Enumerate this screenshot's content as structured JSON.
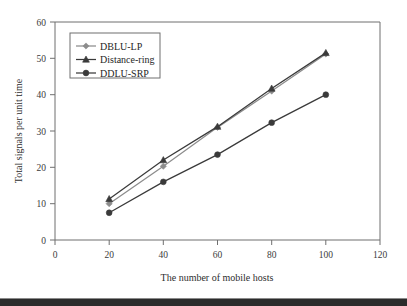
{
  "chart_data": {
    "type": "line",
    "title": "",
    "xlabel": "The number of mobile hosts",
    "ylabel": "Total signals per unit time",
    "xlim": [
      0,
      120
    ],
    "ylim": [
      0,
      60
    ],
    "xticks": [
      0,
      20,
      40,
      60,
      80,
      100,
      120
    ],
    "yticks": [
      0,
      10,
      20,
      30,
      40,
      50,
      60
    ],
    "grid": false,
    "legend_position": "upper-left-inside",
    "x": [
      20,
      40,
      60,
      80,
      100
    ],
    "series": [
      {
        "name": "DBLU-LP",
        "marker": "diamond",
        "color": "#8c8c8c",
        "values": [
          10,
          20.3,
          31,
          41,
          51.2
        ]
      },
      {
        "name": "Distance-ring",
        "marker": "triangle",
        "color": "#3a3a3a",
        "values": [
          11.3,
          22,
          31.2,
          41.7,
          51.5
        ]
      },
      {
        "name": "DDLU-SRP",
        "marker": "circle",
        "color": "#3a3a3a",
        "values": [
          7.5,
          16,
          23.5,
          32.3,
          40
        ]
      }
    ]
  },
  "axes": {
    "x_tick_labels": [
      "0",
      "20",
      "40",
      "60",
      "80",
      "100",
      "120"
    ],
    "y_tick_labels": [
      "0",
      "10",
      "20",
      "30",
      "40",
      "50",
      "60"
    ],
    "x_axis_title": "The number of mobile hosts",
    "y_axis_title": "Total signals per unit time"
  },
  "legend": {
    "items": [
      {
        "label": "DBLU-LP"
      },
      {
        "label": "Distance-ring"
      },
      {
        "label": "DDLU-SRP"
      }
    ]
  },
  "colors": {
    "frame": "#6f6f6f",
    "text": "#2e2e2e",
    "series_light": "#8c8c8c",
    "series_dark": "#3a3a3a",
    "footer_bar": "#2b2b2b"
  }
}
